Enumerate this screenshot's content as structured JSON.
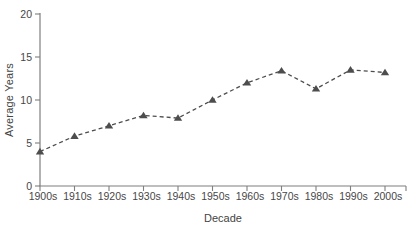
{
  "chart_data": {
    "type": "line",
    "title": "",
    "xlabel": "Decade",
    "ylabel": "Average Years",
    "categories": [
      "1900s",
      "1910s",
      "1920s",
      "1930s",
      "1940s",
      "1950s",
      "1960s",
      "1970s",
      "1980s",
      "1990s",
      "2000s"
    ],
    "values": [
      4.0,
      5.8,
      7.0,
      8.2,
      7.9,
      10.0,
      12.0,
      13.4,
      11.3,
      13.5,
      13.2
    ],
    "ylim": [
      0,
      20
    ],
    "yticks": [
      0,
      5,
      10,
      15,
      20
    ],
    "grid": false,
    "legend": "none",
    "line_style": "dashed",
    "marker": "triangle-up",
    "colors": {
      "line": "#4d4d4d",
      "marker": "#4d4d4d",
      "axis": "#7f7f7f",
      "text": "#474747"
    }
  }
}
